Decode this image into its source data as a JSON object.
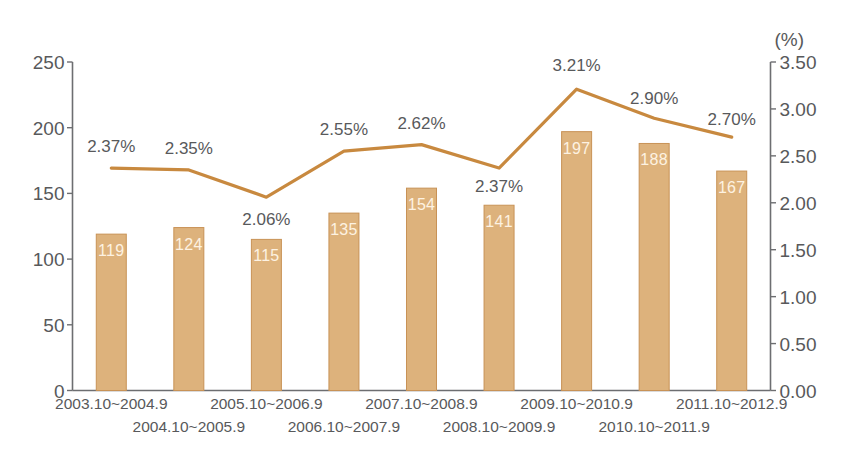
{
  "chart_data": {
    "type": "bar",
    "title": "",
    "xlabel": "",
    "ylabel": "",
    "categories": [
      "2003.10~2004.9",
      "2004.10~2005.9",
      "2005.10~2006.9",
      "2006.10~2007.9",
      "2007.10~2008.9",
      "2008.10~2009.9",
      "2009.10~2010.9",
      "2010.10~2011.9",
      "2011.10~2012.9"
    ],
    "series": [
      {
        "name": "bars",
        "type": "bar",
        "axis": "left",
        "values": [
          119,
          124,
          115,
          135,
          154,
          141,
          197,
          188,
          167
        ],
        "value_labels": [
          "119",
          "124",
          "115",
          "135",
          "154",
          "141",
          "197",
          "188",
          "167"
        ],
        "color": "#ddb27c"
      },
      {
        "name": "line",
        "type": "line",
        "axis": "right",
        "values": [
          2.37,
          2.35,
          2.06,
          2.55,
          2.62,
          2.37,
          3.21,
          2.9,
          2.7
        ],
        "value_labels": [
          "2.37%",
          "2.35%",
          "2.06%",
          "2.55%",
          "2.62%",
          "2.37%",
          "3.21%",
          "2.90%",
          "2.70%"
        ],
        "color": "#c8893f"
      }
    ],
    "left_axis": {
      "ticks": [
        "250",
        "200",
        "150",
        "100",
        "50",
        "0"
      ],
      "values": [
        250,
        200,
        150,
        100,
        50,
        0
      ],
      "ylim": [
        0,
        250
      ],
      "unit": ""
    },
    "right_axis": {
      "ticks": [
        "3.50",
        "3.00",
        "2.50",
        "2.00",
        "1.50",
        "1.00",
        "0.50",
        "0.00"
      ],
      "values": [
        3.5,
        3.0,
        2.5,
        2.0,
        1.5,
        1.0,
        0.5,
        0.0
      ],
      "ylim": [
        0,
        3.5
      ],
      "unit": "(%)"
    },
    "grid": false,
    "legend": "none"
  },
  "colors": {
    "bar_fill": "#ddb27c",
    "bar_edge": "#c89256",
    "line": "#c8893f",
    "axis": "#6d6e71",
    "text": "#58595b",
    "bar_label_text": "#fdf2e2",
    "background": "#ffffff"
  }
}
